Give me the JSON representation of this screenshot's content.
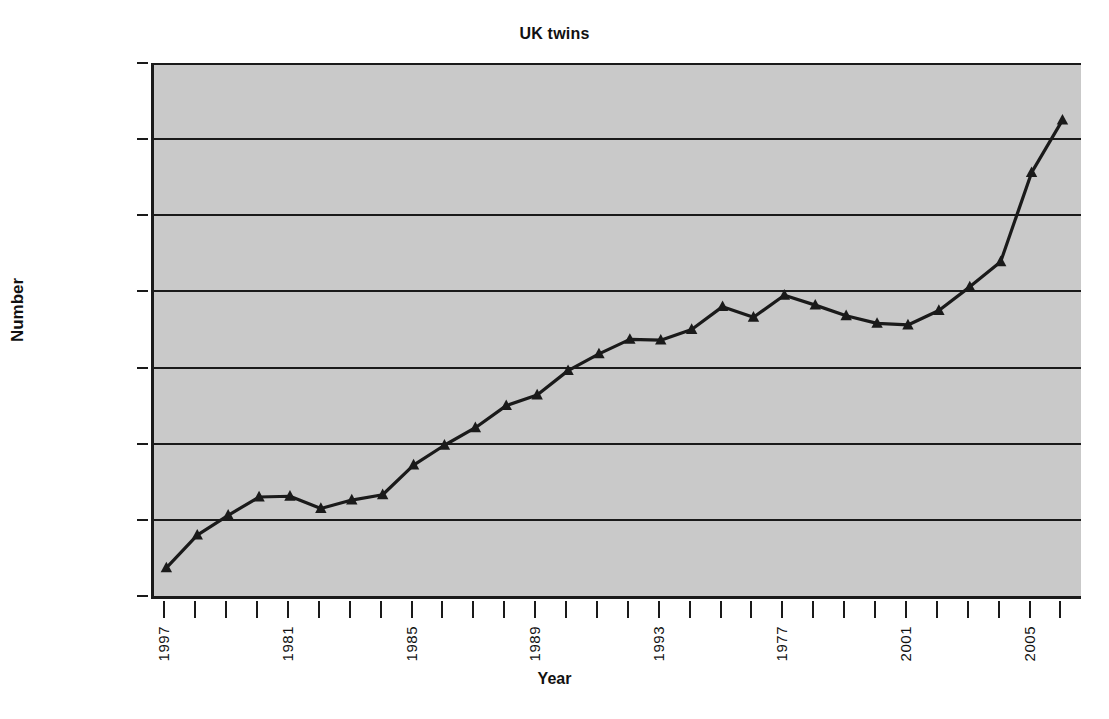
{
  "chart_data": {
    "type": "line",
    "title": "UK twins",
    "xlabel": "Year",
    "ylabel": "Number",
    "ylim": [
      5000,
      12000
    ],
    "ytick_values": [
      5000,
      6000,
      7000,
      8000,
      9000,
      10000,
      11000,
      12000
    ],
    "ytick_labels": [
      "5,000",
      "6,000",
      "7,000",
      "8,000",
      "9,000",
      "10,000",
      "11,000",
      "12,000"
    ],
    "grid": true,
    "legend": "none",
    "marker": "triangle",
    "x": [
      1977,
      1978,
      1979,
      1980,
      1981,
      1982,
      1983,
      1984,
      1985,
      1986,
      1987,
      1988,
      1989,
      1990,
      1991,
      1992,
      1993,
      1994,
      1995,
      1996,
      1997,
      1998,
      1999,
      2000,
      2001,
      2002,
      2003,
      2004,
      2005,
      2006
    ],
    "xtick_labels": [
      "1997",
      "",
      "",
      "",
      "1981",
      "",
      "",
      "",
      "1985",
      "",
      "",
      "",
      "1989",
      "",
      "",
      "",
      "1993",
      "",
      "",
      "",
      "1977",
      "",
      "",
      "",
      "2001",
      "",
      "",
      "",
      "2005",
      ""
    ],
    "values": [
      5370,
      5800,
      6060,
      6300,
      6310,
      6150,
      6260,
      6330,
      6720,
      6980,
      7210,
      7500,
      7640,
      7960,
      8180,
      8370,
      8360,
      8500,
      8800,
      8660,
      8950,
      8820,
      8680,
      8580,
      8560,
      8750,
      9060,
      9390,
      10560,
      11250
    ],
    "series_name": "UK twins",
    "series_color": "#1a1a1a",
    "plot_background": "#c9c9c9"
  }
}
